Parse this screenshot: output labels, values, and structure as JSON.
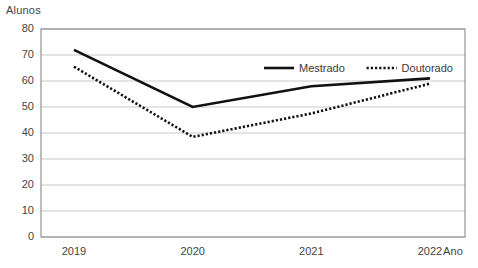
{
  "chart_data": {
    "type": "line",
    "title": "",
    "xlabel": "Ano",
    "ylabel": "Alunos",
    "categories": [
      "2019",
      "2020",
      "2021",
      "2022"
    ],
    "ylim": [
      0,
      80
    ],
    "ytick_step": 10,
    "yticks": [
      "80",
      "70",
      "60",
      "50",
      "40",
      "30",
      "20",
      "10",
      "0"
    ],
    "grid": "horizontal",
    "legend_position": "inside-top-right",
    "series": [
      {
        "name": "Mestrado",
        "values": [
          72,
          50,
          58,
          61
        ],
        "style": "solid",
        "color": "#111111",
        "width": 2.6
      },
      {
        "name": "Doutorado",
        "values": [
          65.5,
          38.5,
          47.5,
          59
        ],
        "style": "dotted",
        "color": "#111111",
        "width": 2.6
      }
    ]
  },
  "axes": {
    "y_axis_label": "Alunos",
    "x_axis_label": "Ano"
  },
  "legend": {
    "items": [
      {
        "label": "Mestrado",
        "style": "solid"
      },
      {
        "label": "Doutorado",
        "style": "dotted"
      }
    ]
  },
  "colors": {
    "grid": "#c9c9c9",
    "frame": "#8a8a8a",
    "series": "#111111",
    "text": "#444444",
    "background": "#ffffff"
  }
}
